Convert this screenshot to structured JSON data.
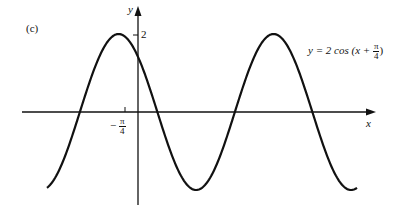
{
  "panel_label": "(c)",
  "chart_data": {
    "type": "line",
    "title": "",
    "equation": "y = 2 cos (x + π/4)",
    "xlabel": "x",
    "ylabel": "y",
    "ytick_labels": [
      "2"
    ],
    "xtick_labels": [
      "-π/4"
    ],
    "amplitude": 2,
    "phase_shift": "-π/4",
    "period": "2π",
    "grid": false,
    "series": [
      {
        "name": "y = 2 cos (x + π/4)",
        "function": "2*cos(x+pi/4)",
        "x_range": [
          "-9π/4 approx",
          "11π/4 approx"
        ]
      }
    ],
    "key_points": [
      {
        "x": "-π/4",
        "y": 2,
        "note": "maximum"
      },
      {
        "x": "3π/4",
        "y": -2,
        "note": "minimum"
      },
      {
        "x": "7π/4",
        "y": 2,
        "note": "maximum"
      }
    ]
  },
  "labels": {
    "y_axis": "y",
    "x_axis": "x",
    "y_tick": "2",
    "x_tick_sign": "−",
    "x_tick_num": "π",
    "x_tick_den": "4",
    "eq_prefix": "y = 2 cos (x + ",
    "eq_num": "π",
    "eq_den": "4",
    "eq_suffix": ")"
  }
}
